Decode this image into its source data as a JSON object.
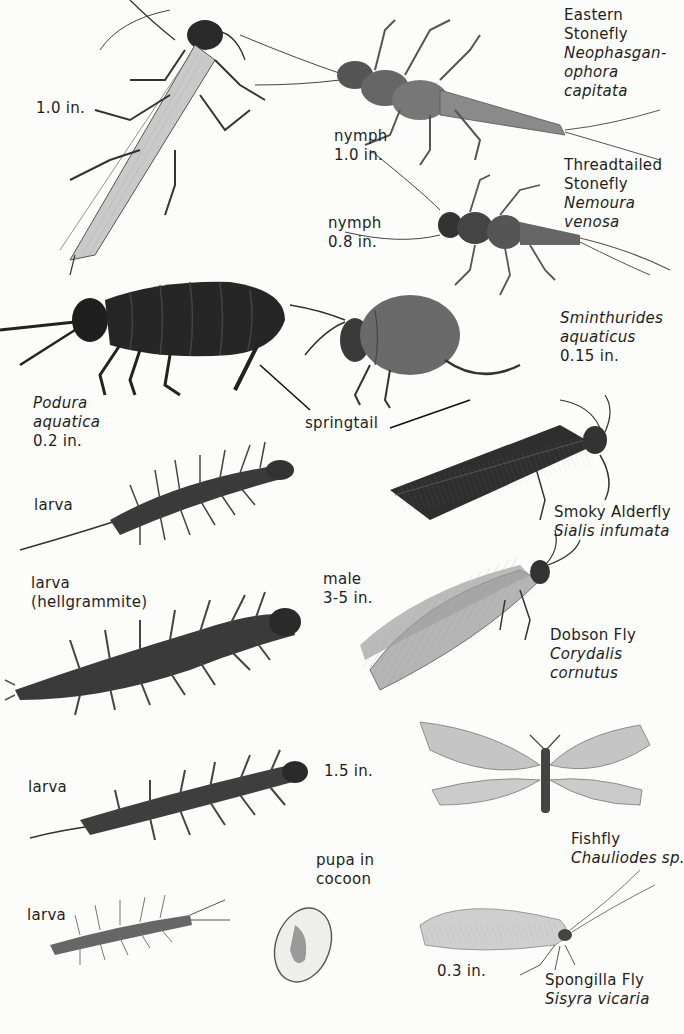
{
  "plate": {
    "labels": [
      {
        "id": "eastern-stonefly",
        "x": 564,
        "y": 6,
        "lines": [
          {
            "text": "Eastern",
            "italic": false
          },
          {
            "text": "Stonefly",
            "italic": false
          },
          {
            "text": "Neophasgan-",
            "italic": true
          },
          {
            "text": "ophora",
            "italic": true
          },
          {
            "text": "capitata",
            "italic": true
          }
        ]
      },
      {
        "id": "adult-stonefly-size",
        "x": 36,
        "y": 99,
        "lines": [
          {
            "text": "1.0 in.",
            "italic": false
          }
        ]
      },
      {
        "id": "eastern-nymph-size",
        "x": 334,
        "y": 127,
        "lines": [
          {
            "text": "nymph",
            "italic": false
          },
          {
            "text": "1.0 in.",
            "italic": false
          }
        ]
      },
      {
        "id": "threadtailed-stonefly",
        "x": 564,
        "y": 156,
        "lines": [
          {
            "text": "Threadtailed",
            "italic": false
          },
          {
            "text": "Stonefly",
            "italic": false
          },
          {
            "text": "Nemoura",
            "italic": true
          },
          {
            "text": "venosa",
            "italic": true
          }
        ]
      },
      {
        "id": "threadtailed-nymph-size",
        "x": 328,
        "y": 214,
        "lines": [
          {
            "text": "nymph",
            "italic": false
          },
          {
            "text": "0.8 in.",
            "italic": false
          }
        ]
      },
      {
        "id": "sminthurides",
        "x": 560,
        "y": 309,
        "lines": [
          {
            "text": "Sminthurides",
            "italic": true
          },
          {
            "text": "aquaticus",
            "italic": true
          },
          {
            "text": "0.15 in.",
            "italic": false
          }
        ]
      },
      {
        "id": "podura",
        "x": 33,
        "y": 394,
        "lines": [
          {
            "text": "Podura",
            "italic": true
          },
          {
            "text": "aquatica",
            "italic": true
          },
          {
            "text": "0.2 in.",
            "italic": false
          }
        ]
      },
      {
        "id": "springtail",
        "x": 305,
        "y": 414,
        "lines": [
          {
            "text": "springtail",
            "italic": false
          }
        ]
      },
      {
        "id": "alderfly-larva",
        "x": 34,
        "y": 496,
        "lines": [
          {
            "text": "larva",
            "italic": false
          }
        ]
      },
      {
        "id": "smoky-alderfly",
        "x": 554,
        "y": 503,
        "lines": [
          {
            "text": "Smoky Alderfly",
            "italic": false
          },
          {
            "text": "Sialis infumata",
            "italic": true
          }
        ]
      },
      {
        "id": "hellgrammite",
        "x": 31,
        "y": 574,
        "lines": [
          {
            "text": "larva",
            "italic": false
          },
          {
            "text": "(hellgrammite)",
            "italic": false
          }
        ]
      },
      {
        "id": "dobson-male-size",
        "x": 323,
        "y": 570,
        "lines": [
          {
            "text": "male",
            "italic": false
          },
          {
            "text": "3-5 in.",
            "italic": false
          }
        ]
      },
      {
        "id": "dobson-fly",
        "x": 550,
        "y": 626,
        "lines": [
          {
            "text": "Dobson Fly",
            "italic": false
          },
          {
            "text": "Corydalis",
            "italic": true
          },
          {
            "text": "cornutus",
            "italic": true
          }
        ]
      },
      {
        "id": "fishfly-larva",
        "x": 28,
        "y": 778,
        "lines": [
          {
            "text": "larva",
            "italic": false
          }
        ]
      },
      {
        "id": "fishfly-larva-size",
        "x": 324,
        "y": 762,
        "lines": [
          {
            "text": "1.5 in.",
            "italic": false
          }
        ]
      },
      {
        "id": "fishfly",
        "x": 571,
        "y": 830,
        "lines": [
          {
            "text": "Fishfly",
            "italic": false
          },
          {
            "text": "Chauliodes sp.",
            "italic": true
          }
        ]
      },
      {
        "id": "pupa",
        "x": 316,
        "y": 851,
        "lines": [
          {
            "text": "pupa in",
            "italic": false
          },
          {
            "text": "cocoon",
            "italic": false
          }
        ]
      },
      {
        "id": "spongilla-larva",
        "x": 27,
        "y": 906,
        "lines": [
          {
            "text": "larva",
            "italic": false
          }
        ]
      },
      {
        "id": "spongilla-size",
        "x": 437,
        "y": 962,
        "lines": [
          {
            "text": "0.3 in.",
            "italic": false
          }
        ]
      },
      {
        "id": "spongilla-fly",
        "x": 545,
        "y": 971,
        "lines": [
          {
            "text": "Spongilla Fly",
            "italic": false
          },
          {
            "text": "Sisyra vicaria",
            "italic": true
          }
        ]
      }
    ],
    "illustrations": [
      "adult-stonefly",
      "eastern-stonefly-nymph",
      "threadtailed-stonefly-nymph",
      "podura-springtail",
      "sminthurides-springtail",
      "alderfly-larva",
      "smoky-alderfly",
      "hellgrammite",
      "dobson-fly",
      "fishfly-larva",
      "fishfly",
      "spongilla-larva",
      "pupa-cocoon",
      "spongilla-fly"
    ],
    "colors": {
      "paper": "#fcfcfa",
      "ink": "#1e1e1e",
      "dark": "#2a2a2a",
      "mid": "#6a6a6a",
      "light": "#b8b8b8"
    }
  }
}
